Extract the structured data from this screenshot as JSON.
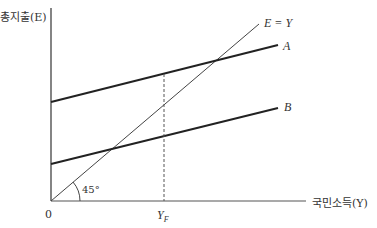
{
  "diagram": {
    "y_axis_label": "총지출(E)",
    "x_axis_label": "국민소득(Y)",
    "origin_label": "0",
    "lines": [
      {
        "name": "E = Y",
        "label": "E = Y"
      },
      {
        "name": "A",
        "label": "A"
      },
      {
        "name": "B",
        "label": "B"
      }
    ],
    "angle_label": "45°",
    "x_marker_label": "Y",
    "x_marker_sub": "F",
    "colors": {
      "axis": "#333333",
      "lines": "#222222",
      "guide": "#555555"
    }
  }
}
